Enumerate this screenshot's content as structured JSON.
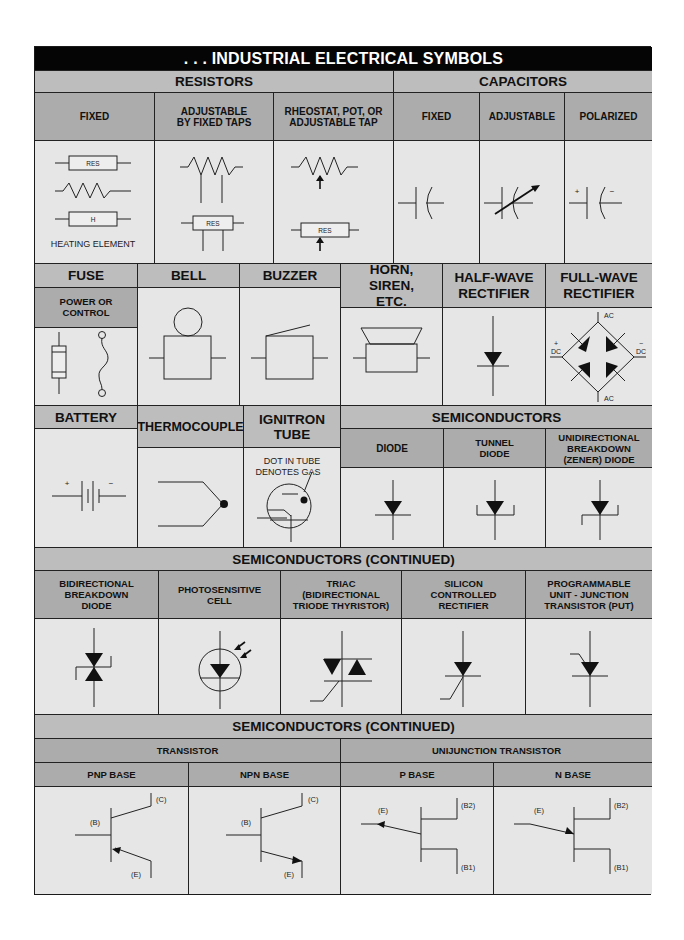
{
  "title": ". . . INDUSTRIAL ELECTRICAL SYMBOLS",
  "resistors": {
    "group": "RESISTORS",
    "fixed": "FIXED",
    "adjustable_taps": "ADJUSTABLE BY FIXED TAPS",
    "rheostat": "RHEOSTAT, POT, OR ADJUSTABLE TAP",
    "res_label": "RES",
    "heater_label": "H",
    "heating_element": "HEATING ELEMENT"
  },
  "capacitors": {
    "group": "CAPACITORS",
    "fixed": "FIXED",
    "adjustable": "ADJUSTABLE",
    "polarized": "POLARIZED",
    "plus": "+",
    "minus": "−"
  },
  "row2": {
    "fuse": "FUSE",
    "fuse_sub": "POWER OR CONTROL",
    "bell": "BELL",
    "buzzer": "BUZZER",
    "horn": "HORN, SIREN, ETC.",
    "half_wave": "HALF-WAVE RECTIFIER",
    "full_wave": "FULL-WAVE RECTIFIER",
    "ac": "AC",
    "dc": "DC",
    "plus": "+",
    "minus": "−"
  },
  "row3": {
    "battery": "BATTERY",
    "thermocouple": "THERMOCOUPLE",
    "ignitron": "IGNITRON TUBE",
    "ignitron_note": "DOT IN TUBE DENOTES GAS",
    "semis_group": "SEMICONDUCTORS",
    "diode": "DIODE",
    "tunnel_diode": "TUNNEL DIODE",
    "zener": "UNIDIRECTIONAL BREAKDOWN (ZENER) DIODE",
    "plus": "+",
    "minus": "−"
  },
  "row4": {
    "group": "SEMICONDUCTORS (CONTINUED)",
    "bidirectional": "BIDIRECTIONAL BREAKDOWN DIODE",
    "photo": "PHOTOSENSITIVE CELL",
    "triac": "TRIAC (BIDIRECTIONAL TRIODE THYRISTOR)",
    "scr": "SILICON CONTROLLED RECTIFIER",
    "put": "PROGRAMMABLE UNIT - JUNCTION TRANSISTOR (PUT)"
  },
  "row5": {
    "group": "SEMICONDUCTORS (CONTINUED)",
    "transistor": "TRANSISTOR",
    "ujt": "UNIJUNCTION TRANSISTOR",
    "pnp": "PNP BASE",
    "npn": "NPN BASE",
    "p_base": "P BASE",
    "n_base": "N BASE",
    "c": "(C)",
    "b": "(B)",
    "e": "(E)",
    "b1": "(B1)",
    "b2": "(B2)"
  }
}
